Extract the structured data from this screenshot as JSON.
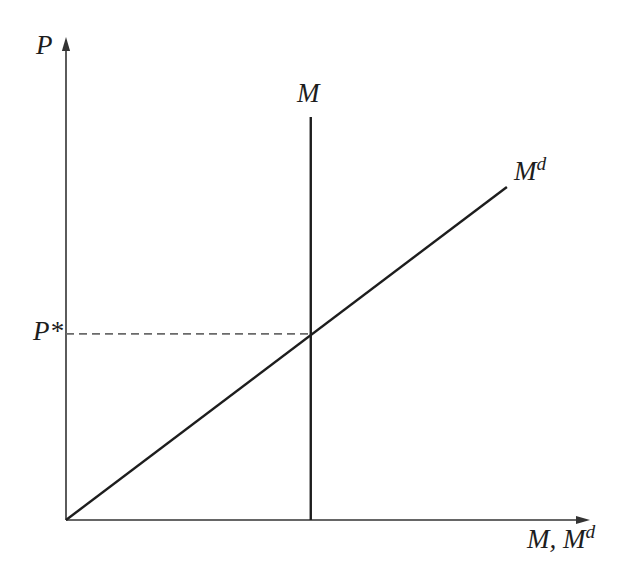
{
  "figure": {
    "background": "#ffffff",
    "curve_color": "#1d1d1d",
    "axis_color": "#333333",
    "dash_color": "#6a6a6a",
    "labels": {
      "y_axis": "P",
      "supply": "M",
      "demand_base": "M",
      "demand_sup": "d",
      "equilibrium_price": "P*",
      "x_axis_base": "M, M",
      "x_axis_sup": "d"
    }
  },
  "chart_data": {
    "type": "line",
    "title": "",
    "xlabel": "M, M^d (nominal money)",
    "ylabel": "P (price level)",
    "xlim": [
      0,
      1
    ],
    "ylim": [
      0,
      1
    ],
    "grid": false,
    "legend": "none",
    "series": [
      {
        "name": "M (money supply, vertical)",
        "style": "solid",
        "points": [
          [
            0.468,
            0
          ],
          [
            0.468,
            0.836
          ]
        ]
      },
      {
        "name": "M^d (money demand, through origin)",
        "style": "solid",
        "points": [
          [
            0,
            0
          ],
          [
            0.843,
            0.691
          ]
        ]
      },
      {
        "name": "P* equilibrium dashed guide",
        "style": "dashed",
        "points": [
          [
            0,
            0.386
          ],
          [
            0.468,
            0.386
          ]
        ]
      }
    ],
    "equilibrium": {
      "x": 0.468,
      "y": 0.386,
      "label": "P*"
    },
    "annotations": [
      {
        "text": "P",
        "position": "top of y-axis"
      },
      {
        "text": "M",
        "position": "above supply line"
      },
      {
        "text": "M^d",
        "position": "right end of demand line"
      },
      {
        "text": "P*",
        "position": "y-axis at equilibrium"
      },
      {
        "text": "M, M^d",
        "position": "below right end of x-axis"
      }
    ]
  }
}
